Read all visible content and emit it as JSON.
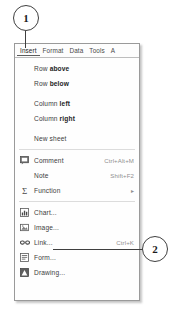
{
  "callouts": [
    {
      "id": "callout-1",
      "label": "1",
      "points_to": "insert-menu-tab"
    },
    {
      "id": "callout-2",
      "label": "2",
      "points_to": "menu-item-image"
    }
  ],
  "menu_bar": {
    "tabs": [
      {
        "label": "Insert",
        "active": true
      },
      {
        "label": "Format",
        "active": false
      },
      {
        "label": "Data",
        "active": false
      },
      {
        "label": "Tools",
        "active": false
      },
      {
        "label": "A",
        "active": false
      }
    ]
  },
  "menu": {
    "groups": [
      {
        "items": [
          {
            "label_plain": "Row ",
            "label_bold": "above",
            "icon": "",
            "shortcut": "",
            "submenu": false
          },
          {
            "label_plain": "Row ",
            "label_bold": "below",
            "icon": "",
            "shortcut": "",
            "submenu": false
          }
        ]
      },
      {
        "items": [
          {
            "label_plain": "Column ",
            "label_bold": "left",
            "icon": "",
            "shortcut": "",
            "submenu": false
          },
          {
            "label_plain": "Column ",
            "label_bold": "right",
            "icon": "",
            "shortcut": "",
            "submenu": false
          }
        ]
      },
      {
        "items": [
          {
            "label_plain": "New sheet",
            "label_bold": "",
            "icon": "",
            "shortcut": "",
            "submenu": false
          }
        ]
      },
      {
        "items": [
          {
            "label_plain": "Comment",
            "label_bold": "",
            "icon": "comment-icon",
            "shortcut": "Ctrl+Alt+M",
            "submenu": false
          },
          {
            "label_plain": "Note",
            "label_bold": "",
            "icon": "",
            "shortcut": "Shift+F2",
            "submenu": false
          },
          {
            "label_plain": "Function",
            "label_bold": "",
            "icon": "sigma-icon",
            "shortcut": "",
            "submenu": true
          }
        ]
      },
      {
        "items": [
          {
            "label_plain": "Chart...",
            "label_bold": "",
            "icon": "chart-icon",
            "shortcut": "",
            "submenu": false
          },
          {
            "label_plain": "Image...",
            "label_bold": "",
            "icon": "image-icon",
            "shortcut": "",
            "submenu": false
          },
          {
            "label_plain": "Link...",
            "label_bold": "",
            "icon": "link-icon",
            "shortcut": "Ctrl+K",
            "submenu": false
          },
          {
            "label_plain": "Form...",
            "label_bold": "",
            "icon": "form-icon",
            "shortcut": "",
            "submenu": false
          },
          {
            "label_plain": "Drawing...",
            "label_bold": "",
            "icon": "drawing-icon",
            "shortcut": "",
            "submenu": false
          }
        ]
      }
    ],
    "submenu_arrow": "▸"
  },
  "colors": {
    "panel_bg": "#fefefe",
    "panel_border": "#9a9a9a",
    "text": "#3d3d3d",
    "text_bold": "#242424",
    "shortcut": "#8f8f8f",
    "separator": "#dcdcdc",
    "callout_line": "#3f3f3f"
  }
}
